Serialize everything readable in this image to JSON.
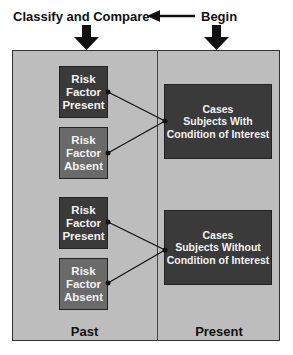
{
  "header": {
    "classify_label": "Classify and Compare",
    "begin_label": "Begin"
  },
  "past_column": {
    "label": "Past",
    "groups": [
      {
        "present": [
          "Risk",
          "Factor",
          "Present"
        ],
        "absent": [
          "Risk",
          "Factor",
          "Absent"
        ]
      },
      {
        "present": [
          "Risk",
          "Factor",
          "Present"
        ],
        "absent": [
          "Risk",
          "Factor",
          "Absent"
        ]
      }
    ]
  },
  "present_column": {
    "label": "Present",
    "cases": [
      {
        "line1": "Cases",
        "line2": "Subjects With",
        "line3": "Condition of Interest"
      },
      {
        "line1": "Cases",
        "line2": "Subjects Without",
        "line3": "Condition of Interest"
      }
    ]
  },
  "colors": {
    "frame": "#bdbdbd",
    "dark_box": "#3a3a3a",
    "mid_box": "#6a6a6a"
  }
}
